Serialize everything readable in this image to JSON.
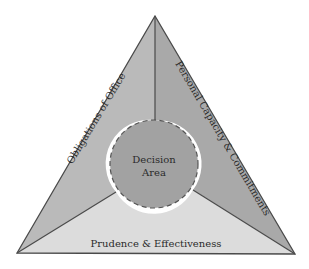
{
  "diagram": {
    "type": "triangle-with-central-circle",
    "segments": [
      {
        "id": "left",
        "label": "Obligations of Office",
        "color": "#bababa"
      },
      {
        "id": "right",
        "label": "Personal Capacity & Commitments",
        "color": "#a9a9a9"
      },
      {
        "id": "bottom",
        "label": "Prudence & Effectiveness",
        "color": "#dcdcdc"
      }
    ],
    "center": {
      "line1": "Decision",
      "line2": "Area",
      "color": "#a2a2a2",
      "border": "dashed"
    },
    "outline_color": "#4a4a4a"
  }
}
